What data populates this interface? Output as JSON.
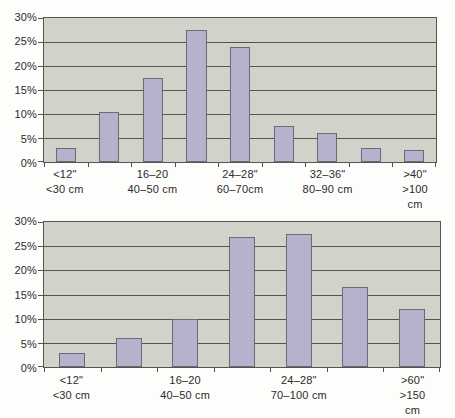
{
  "figure": {
    "background": "#fdfdfb"
  },
  "colors": {
    "plot_background": "#d3d2ca",
    "gridline": "#55554e",
    "bar_fill": "#b5b2ce",
    "bar_border": "#6b6a7a",
    "axis_text": "#2b2b2b"
  },
  "chart_data": [
    {
      "type": "bar",
      "title": "",
      "xlabel": "",
      "ylabel": "",
      "ylim": [
        0,
        30
      ],
      "ytick_step": 5,
      "ytick_labels": [
        "30%",
        "25%",
        "20%",
        "15%",
        "10%",
        "5%",
        "0%"
      ],
      "grid": true,
      "legend": "none",
      "categories": [
        "<12\"\n<30 cm",
        "",
        "16–20\n40–50 cm",
        "",
        "24–28\"\n60–70cm",
        "",
        "32–36\"\n80–90 cm",
        "",
        ">40\"\n>100 cm"
      ],
      "values": [
        3,
        10.5,
        17.5,
        27.5,
        24,
        7.5,
        6,
        3,
        2.5
      ]
    },
    {
      "type": "bar",
      "title": "",
      "xlabel": "",
      "ylabel": "",
      "ylim": [
        0,
        30
      ],
      "ytick_step": 5,
      "ytick_labels": [
        "30%",
        "25%",
        "20%",
        "15%",
        "10%",
        "5%",
        "0%"
      ],
      "grid": true,
      "legend": "none",
      "categories": [
        "<12\"\n<30 cm",
        "",
        "16–20\n40–50 cm",
        "",
        "24–28\"\n70–100 cm",
        "",
        ">60\"\n>150 cm"
      ],
      "values": [
        3,
        6,
        10,
        27,
        27.5,
        16.5,
        12
      ]
    }
  ]
}
